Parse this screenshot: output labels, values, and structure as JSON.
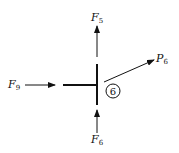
{
  "diagram": {
    "type": "free-body force diagram",
    "node_label": "6",
    "forces": [
      {
        "id": "F5",
        "base": "F",
        "sub": "5",
        "direction": "up"
      },
      {
        "id": "F9",
        "base": "F",
        "sub": "9",
        "direction": "right"
      },
      {
        "id": "F6",
        "base": "F",
        "sub": "6",
        "direction": "up (from below)"
      },
      {
        "id": "P6",
        "base": "P",
        "sub": "6",
        "direction": "up-right"
      }
    ],
    "colors": {
      "ink": "#111111",
      "background": "#ffffff"
    }
  }
}
